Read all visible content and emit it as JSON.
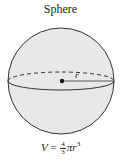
{
  "title": "Sphere",
  "label_radius": "r",
  "formula": {
    "lhs": "V",
    "eq": " = ",
    "frac_num": "4",
    "frac_den": "3",
    "pi": "π",
    "var": "r",
    "exp": "3"
  },
  "colors": {
    "fill": "#e6e6e6",
    "stroke": "#333333"
  }
}
